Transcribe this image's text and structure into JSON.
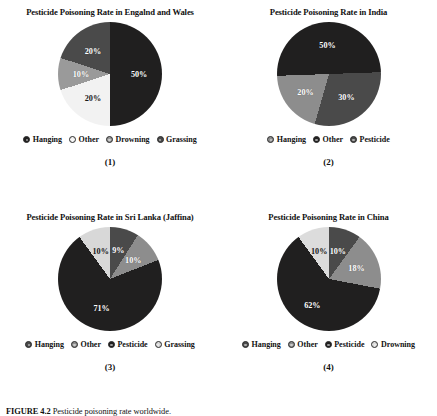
{
  "figure": {
    "caption_label": "FIGURE 4.2",
    "caption_text": "Pesticide poisoning rate worldwide."
  },
  "palette": {
    "black": "#201f1f",
    "dark_gray": "#4a4a4a",
    "medium_gray": "#8d8d8d",
    "light_gray": "#e2e2e2",
    "white_slice": "#f2f2f2",
    "label_text": "#ffffff",
    "title_text": "#111111"
  },
  "panels": [
    {
      "number": "(1)",
      "chart_data": {
        "type": "pie",
        "title": "Pesticide Poisoning Rate in Engalnd and Wales",
        "categories": [
          "Hanging",
          "Other",
          "Drowning",
          "Grassing"
        ],
        "values": [
          50,
          20,
          10,
          20
        ],
        "labels": [
          "50%",
          "20%",
          "10%",
          "20%"
        ],
        "colors": [
          "#201f1f",
          "#f2f2f2",
          "#9a9a9a",
          "#4a4a4a"
        ],
        "legend_position": "bottom"
      }
    },
    {
      "number": "(2)",
      "chart_data": {
        "type": "pie",
        "title": "Pesticide Poisoning Rate in India",
        "categories": [
          "Hanging",
          "Other",
          "Pesticide"
        ],
        "values": [
          20,
          50,
          30
        ],
        "labels": [
          "20%",
          "50%",
          "30%"
        ],
        "colors": [
          "#8d8d8d",
          "#201f1f",
          "#4a4a4a"
        ],
        "legend_position": "bottom"
      }
    },
    {
      "number": "(3)",
      "chart_data": {
        "type": "pie",
        "title": "Pesticide Poisoning Rate in Sri Lanka (Jaffina)",
        "categories": [
          "Hanging",
          "Other",
          "Pesticide",
          "Grassing"
        ],
        "values": [
          9,
          10,
          71,
          10
        ],
        "labels": [
          "9%",
          "10%",
          "71%",
          "10%"
        ],
        "colors": [
          "#4a4a4a",
          "#8d8d8d",
          "#201f1f",
          "#d8d8d8"
        ],
        "legend_position": "bottom"
      }
    },
    {
      "number": "(4)",
      "chart_data": {
        "type": "pie",
        "title": "Pesticide Poisoning Rate in China",
        "categories": [
          "Hanging",
          "Other",
          "Pesticide",
          "Drowning"
        ],
        "values": [
          10,
          18,
          62,
          10
        ],
        "labels": [
          "10%",
          "18%",
          "62%",
          "10%"
        ],
        "colors": [
          "#4a4a4a",
          "#8d8d8d",
          "#201f1f",
          "#dcdcdc"
        ],
        "legend_position": "bottom"
      }
    }
  ]
}
